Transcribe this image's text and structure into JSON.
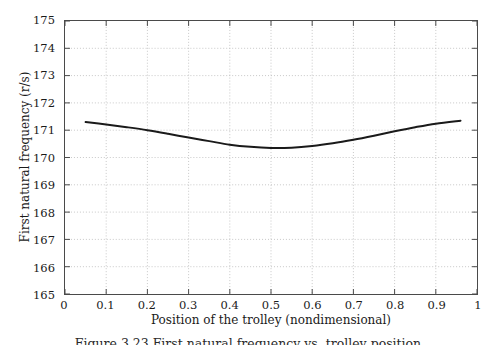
{
  "figure": {
    "caption": "Figure 3.23 First natural frequency vs. trolley position",
    "background_color": "#ffffff",
    "frame_color": "#4a4a4a",
    "grid_color": "#b9b9b9",
    "curve_color": "#1a1a1a"
  },
  "chart_data": {
    "type": "line",
    "title": "",
    "xlabel": "Position of the trolley (nondimensional)",
    "ylabel": "First natural frequency (r/s)",
    "xlim": [
      0,
      1
    ],
    "ylim": [
      165,
      175
    ],
    "xticks": [
      0,
      0.1,
      0.2,
      0.3,
      0.4,
      0.5,
      0.6,
      0.7,
      0.8,
      0.9,
      1
    ],
    "xtick_labels": [
      "0",
      "0.1",
      "0.2",
      "0.3",
      "0.4",
      "0.5",
      "0.6",
      "0.7",
      "0.8",
      "0.9",
      "1"
    ],
    "yticks": [
      165,
      166,
      167,
      168,
      169,
      170,
      171,
      172,
      173,
      174,
      175
    ],
    "ytick_labels": [
      "165",
      "166",
      "167",
      "168",
      "169",
      "170",
      "171",
      "172",
      "173",
      "174",
      "175"
    ],
    "grid": true,
    "grid_style": "dotted",
    "legend": false,
    "series": [
      {
        "name": "First natural frequency",
        "x": [
          0.05,
          0.1,
          0.15,
          0.2,
          0.25,
          0.3,
          0.35,
          0.4,
          0.45,
          0.5,
          0.55,
          0.6,
          0.65,
          0.7,
          0.75,
          0.8,
          0.85,
          0.9,
          0.96
        ],
        "values": [
          171.3,
          171.21,
          171.11,
          171.0,
          170.87,
          170.73,
          170.6,
          170.47,
          170.39,
          170.35,
          170.36,
          170.42,
          170.52,
          170.65,
          170.8,
          170.96,
          171.11,
          171.24,
          171.35
        ]
      }
    ]
  }
}
